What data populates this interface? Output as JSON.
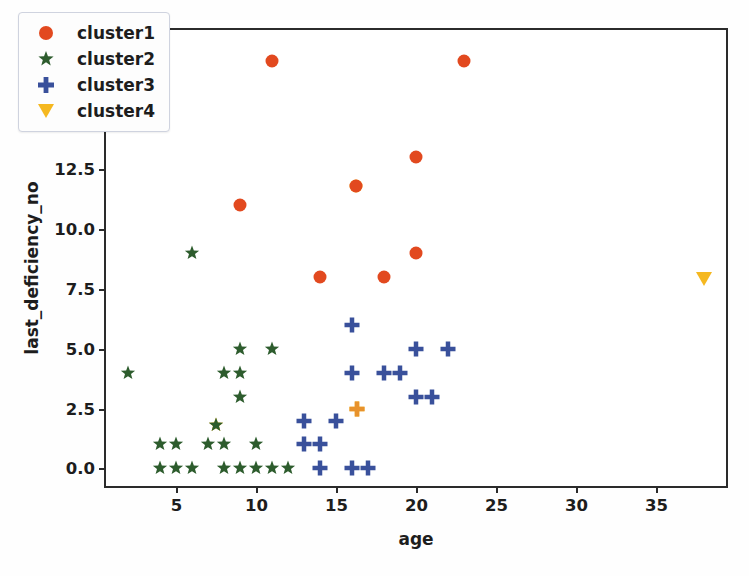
{
  "chart_data": {
    "type": "scatter",
    "title": "",
    "xlabel": "age",
    "ylabel": "last_deficiency_no",
    "xlim": [
      0.6,
      39.6
    ],
    "ylim": [
      -0.9,
      18.3
    ],
    "xticks": [
      5,
      10,
      15,
      20,
      25,
      30,
      35
    ],
    "yticks": [
      "0.0",
      "2.5",
      "5.0",
      "7.5",
      "10.0",
      "12.5",
      "15.0",
      "17.5"
    ],
    "ytick_values": [
      0,
      2.5,
      5,
      7.5,
      10,
      12.5,
      15,
      17.5
    ],
    "grid": false,
    "legend_position": "upper left",
    "series": [
      {
        "name": "cluster1",
        "marker": "circle",
        "color": "#e2491f",
        "points": [
          [
            11,
            17
          ],
          [
            23,
            17
          ],
          [
            20,
            13
          ],
          [
            16.2,
            11.8
          ],
          [
            9,
            11
          ],
          [
            20,
            9
          ],
          [
            14,
            8
          ],
          [
            18,
            8
          ]
        ]
      },
      {
        "name": "cluster2",
        "marker": "star",
        "color": "#2d5c2d",
        "points": [
          [
            6,
            9
          ],
          [
            9,
            5
          ],
          [
            11,
            5
          ],
          [
            2,
            4
          ],
          [
            8,
            4
          ],
          [
            9,
            4
          ],
          [
            9,
            3
          ],
          [
            7.5,
            1.8
          ],
          [
            4,
            1
          ],
          [
            5,
            1
          ],
          [
            7,
            1
          ],
          [
            8,
            1
          ],
          [
            10,
            1
          ],
          [
            4,
            0
          ],
          [
            5,
            0
          ],
          [
            6,
            0
          ],
          [
            8,
            0
          ],
          [
            9,
            0
          ],
          [
            10,
            0
          ],
          [
            11,
            0
          ],
          [
            12,
            0
          ]
        ]
      },
      {
        "name": "cluster3",
        "marker": "plus",
        "color": "#39509b",
        "points": [
          [
            16,
            6
          ],
          [
            20,
            5
          ],
          [
            22,
            5
          ],
          [
            16,
            4
          ],
          [
            18,
            4
          ],
          [
            19,
            4
          ],
          [
            20,
            3
          ],
          [
            21,
            3
          ],
          [
            13,
            2
          ],
          [
            15,
            2
          ],
          [
            13,
            1
          ],
          [
            14,
            1
          ],
          [
            14,
            0
          ],
          [
            16,
            0
          ],
          [
            17,
            0
          ]
        ]
      },
      {
        "name": "cluster4",
        "marker": "triangle-down",
        "color": "#f5b820",
        "points": [
          [
            38,
            7.9
          ],
          [
            16.2,
            11.8
          ],
          [
            7.5,
            1.8
          ]
        ],
        "overlap_markers": [
          {
            "x": 16.2,
            "y": 11.8,
            "shape": "circle",
            "note": "behind cluster1 circle"
          },
          {
            "x": 7.5,
            "y": 1.8,
            "shape": "star",
            "note": "orange star overlap"
          },
          {
            "x": 16.3,
            "y": 2.5,
            "shape": "plus",
            "note": "orange plus overlap"
          }
        ]
      }
    ],
    "extra_points": [
      {
        "x": 16.3,
        "y": 2.5,
        "color": "#e8922c",
        "marker": "plus"
      }
    ]
  },
  "legend": {
    "items": [
      {
        "label": "cluster1",
        "marker": "circle",
        "color": "#e2491f"
      },
      {
        "label": "cluster2",
        "marker": "star",
        "color": "#2d5c2d"
      },
      {
        "label": "cluster3",
        "marker": "plus",
        "color": "#39509b"
      },
      {
        "label": "cluster4",
        "marker": "triangle-down",
        "color": "#f5b820"
      }
    ]
  }
}
